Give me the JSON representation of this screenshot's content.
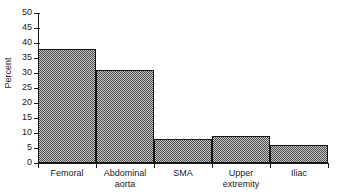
{
  "chart_data": {
    "type": "bar",
    "title": "",
    "xlabel": "",
    "ylabel": "Percent",
    "ylim": [
      0,
      50
    ],
    "yticks": [
      0,
      5,
      10,
      15,
      20,
      25,
      30,
      35,
      40,
      45,
      50
    ],
    "grid": false,
    "legend": "none",
    "categories": [
      "Femoral",
      "Abdominal aorta",
      "SMA",
      "Upper extremity",
      "Iliac"
    ],
    "category_lines": [
      [
        "Femoral"
      ],
      [
        "Abdominal",
        "aorta"
      ],
      [
        "SMA"
      ],
      [
        "Upper",
        "extremity"
      ],
      [
        "Iliac"
      ]
    ],
    "values": [
      38,
      31,
      8,
      9,
      6
    ],
    "bar_fill": "#7d7d7d",
    "bar_border": "#141414",
    "axis_color": "#1a1a1a",
    "background": "#ffffff"
  }
}
